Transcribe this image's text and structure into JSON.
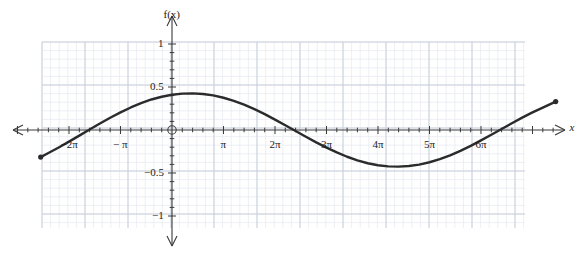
{
  "figure": {
    "axis_label_y": "f(x)",
    "axis_label_x": "x",
    "origin_marker": "origin-circle"
  },
  "chart_data": {
    "type": "line",
    "title": "",
    "xlabel": "x",
    "ylabel": "f(x)",
    "xlim": [
      -2.6,
      7.1
    ],
    "ylim": [
      -1,
      1
    ],
    "grid": true,
    "grid_minor": true,
    "legend": "none",
    "x_unit": "pi",
    "x_tick_labels": [
      "−2π",
      "− π",
      "π",
      "2π",
      "3π",
      "4π",
      "5π",
      "6π"
    ],
    "x_tick_values_in_pi": [
      -2,
      -1,
      1,
      2,
      3,
      4,
      5,
      6
    ],
    "y_tick_labels": [
      "1",
      "0.5",
      "−0.5",
      "−1"
    ],
    "y_tick_values": [
      1,
      0.5,
      -0.5,
      -1
    ],
    "function": "f(x) = 0.45 cos(x/3)",
    "amplitude": 0.45,
    "period_in_pi": 6,
    "series": [
      {
        "name": "f(x)",
        "color": "#2b2b2b",
        "endpoints_marked": true,
        "x_in_pi": [
          -2.55,
          -2.4,
          -2.2,
          -2.0,
          -1.8,
          -1.6,
          -1.4,
          -1.2,
          -1.0,
          -0.8,
          -0.6,
          -0.4,
          -0.2,
          0.0,
          0.2,
          0.4,
          0.6,
          0.8,
          1.0,
          1.2,
          1.4,
          1.6,
          1.8,
          2.0,
          2.2,
          2.4,
          2.6,
          2.8,
          3.0,
          3.2,
          3.4,
          3.6,
          3.8,
          4.0,
          4.2,
          4.4,
          4.6,
          4.8,
          5.0,
          5.2,
          5.4,
          5.6,
          5.8,
          6.0,
          6.2,
          6.4,
          6.6,
          6.8,
          7.0,
          7.2,
          7.45
        ],
        "y": [
          -0.315,
          -0.268,
          -0.203,
          -0.135,
          -0.065,
          0.006,
          0.075,
          0.142,
          0.205,
          0.262,
          0.312,
          0.355,
          0.387,
          0.41,
          0.423,
          0.426,
          0.419,
          0.402,
          0.375,
          0.339,
          0.294,
          0.242,
          0.184,
          0.121,
          0.055,
          -0.012,
          -0.079,
          -0.144,
          -0.205,
          -0.261,
          -0.311,
          -0.354,
          -0.387,
          -0.41,
          -0.423,
          -0.426,
          -0.419,
          -0.402,
          -0.375,
          -0.339,
          -0.294,
          -0.242,
          -0.184,
          -0.121,
          -0.055,
          0.012,
          0.079,
          0.144,
          0.205,
          0.261,
          0.33
        ]
      }
    ]
  },
  "ticks": {
    "x": [
      {
        "label": "−2π",
        "pi": -2
      },
      {
        "label": "− π",
        "pi": -1
      },
      {
        "label": "π",
        "pi": 1
      },
      {
        "label": "2π",
        "pi": 2
      },
      {
        "label": "3π",
        "pi": 3
      },
      {
        "label": "4π",
        "pi": 4
      },
      {
        "label": "5π",
        "pi": 5
      },
      {
        "label": "6π",
        "pi": 6
      }
    ],
    "y": [
      {
        "label": "1",
        "value": 1
      },
      {
        "label": "0.5",
        "value": 0.5
      },
      {
        "label": "−0.5",
        "value": -0.5
      },
      {
        "label": "−1",
        "value": -1
      }
    ]
  },
  "colors": {
    "curve": "#2b2b2b",
    "axis": "#3a3a3a",
    "grid_minor": "#e8ebf2",
    "grid_major": "#c9cfdb",
    "text": "#1b1b1b",
    "background": "#ffffff"
  }
}
